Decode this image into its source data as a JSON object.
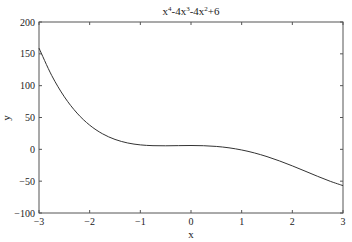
{
  "chart_data": {
    "type": "line",
    "title_parts": [
      {
        "text": "x",
        "sup": "4"
      },
      {
        "text": "-4x",
        "sup": "3"
      },
      {
        "text": "-4x",
        "sup": "2"
      },
      {
        "text": "+6",
        "sup": ""
      }
    ],
    "xlabel": "x",
    "ylabel": "y",
    "xlim": [
      -3,
      3
    ],
    "ylim": [
      -100,
      200
    ],
    "xticks": [
      -3,
      -2,
      -1,
      0,
      1,
      2,
      3
    ],
    "xtick_labels": [
      "−3",
      "−2",
      "−1",
      "0",
      "1",
      "2",
      "3"
    ],
    "yticks": [
      -100,
      -50,
      0,
      50,
      100,
      150,
      200
    ],
    "ytick_labels": [
      "−100",
      "−50",
      "0",
      "50",
      "100",
      "150",
      "200"
    ],
    "grid": false,
    "legend": null,
    "series": [
      {
        "name": "x^4-4x^3-4x^2+6",
        "color": "#333333",
        "x": [
          -3,
          -2.75,
          -2.5,
          -2.25,
          -2,
          -1.75,
          -1.5,
          -1.25,
          -1,
          -0.75,
          -0.5,
          -0.25,
          0,
          0.25,
          0.5,
          0.75,
          1,
          1.25,
          1.5,
          1.75,
          2,
          2.25,
          2.5,
          2.75,
          3
        ],
        "y": [
          159,
          116.13,
          82.56,
          56.94,
          38,
          24.57,
          15.56,
          10.0,
          7,
          5.76,
          5.56,
          5.82,
          6,
          5.69,
          4.56,
          2.38,
          -1,
          -5.62,
          -11.44,
          -18.31,
          -26,
          -34.18,
          -42.44,
          -50.25,
          -57
        ]
      }
    ]
  },
  "colors": {
    "axes": "#555555",
    "line": "#333333",
    "background": "#ffffff"
  }
}
